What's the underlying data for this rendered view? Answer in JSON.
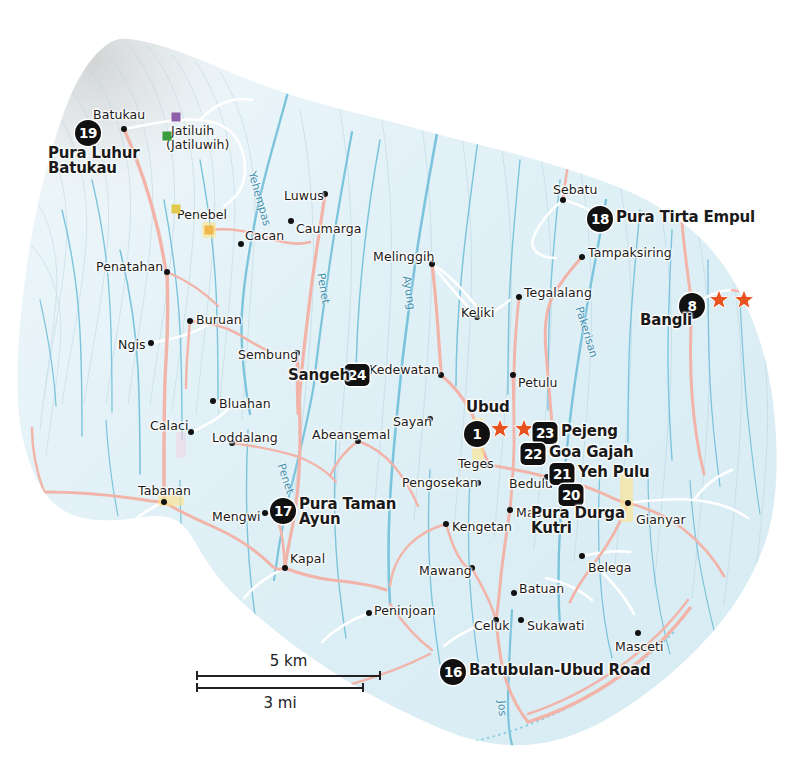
{
  "map": {
    "title": "Ubud and Central Bali Region Map",
    "colors": {
      "land": "#e8f2f6",
      "relief_highlight": "#f4f9fb",
      "road_major": "#f2b3a8",
      "road_minor": "#ffffff",
      "river": "#7cc4dc",
      "badge_bg": "#111111",
      "badge_text": "#ffffff",
      "star": "#e8521e",
      "label_text": "#1a1a1a",
      "river_label": "#3f8fae",
      "background": "#ffffff"
    }
  },
  "scalebar": {
    "km_label": "5 km",
    "mi_label": "3 mi"
  },
  "pois": [
    {
      "num": "19",
      "shape": "circle",
      "label": "Pura Luhur\nBatukau",
      "bx": 88,
      "by": 133,
      "tx": 48,
      "ty": 146,
      "align": "left",
      "lines": [
        "Pura Luhur",
        "Batukau"
      ]
    },
    {
      "num": "18",
      "shape": "circle",
      "label": "Pura Tirta Empul",
      "bx": 600,
      "by": 219,
      "tx": 616,
      "ty": 210,
      "align": "left",
      "lines": [
        "Pura Tirta Empul"
      ]
    },
    {
      "num": "8",
      "shape": "circle",
      "label": "Bangli",
      "bx": 692,
      "by": 306,
      "tx": 640,
      "ty": 313,
      "align": "left",
      "lines": [
        "Bangli"
      ]
    },
    {
      "num": "24",
      "shape": "square",
      "label": "Sangeh",
      "bx": 357,
      "by": 375,
      "tx": 288,
      "ty": 368,
      "align": "left",
      "lines": [
        "Sangeh"
      ]
    },
    {
      "num": "1",
      "shape": "circle",
      "label": "Ubud",
      "bx": 477,
      "by": 434,
      "tx": 466,
      "ty": 400,
      "align": "left",
      "lines": [
        "Ubud"
      ]
    },
    {
      "num": "23",
      "shape": "square",
      "label": "Pejeng",
      "bx": 545,
      "by": 433,
      "tx": 561,
      "ty": 424,
      "align": "left",
      "lines": [
        "Pejeng"
      ]
    },
    {
      "num": "22",
      "shape": "square",
      "label": "Goa Gajah",
      "bx": 533,
      "by": 454,
      "tx": 549,
      "ty": 445,
      "align": "left",
      "lines": [
        "Goa Gajah"
      ]
    },
    {
      "num": "21",
      "shape": "square",
      "label": "Yeh Pulu",
      "bx": 562,
      "by": 474,
      "tx": 578,
      "ty": 465,
      "align": "left",
      "lines": [
        "Yeh Pulu"
      ]
    },
    {
      "num": "20",
      "shape": "square",
      "label": "Pura Durga\nKutri",
      "bx": 571,
      "by": 495,
      "tx": 531,
      "ty": 506,
      "align": "left",
      "lines": [
        "Pura Durga",
        "Kutri"
      ]
    },
    {
      "num": "17",
      "shape": "circle",
      "label": "Pura Taman\nAyun",
      "bx": 283,
      "by": 511,
      "tx": 299,
      "ty": 497,
      "align": "left",
      "lines": [
        "Pura Taman",
        "Ayun"
      ]
    },
    {
      "num": "16",
      "shape": "circle",
      "label": "Batubulan-Ubud Road",
      "bx": 453,
      "by": 672,
      "tx": 469,
      "ty": 663,
      "align": "left",
      "lines": [
        "Batubulan-Ubud Road"
      ]
    }
  ],
  "stars": [
    {
      "x": 500,
      "y": 431
    },
    {
      "x": 524,
      "y": 431
    },
    {
      "x": 719,
      "y": 302
    },
    {
      "x": 744,
      "y": 302
    }
  ],
  "towns": [
    {
      "name": "Batukau",
      "dx": 124,
      "dy": 129,
      "tx": 93,
      "ty": 107,
      "anchor": "left"
    },
    {
      "name": "Jatiluih",
      "dx": 176,
      "dy": 117,
      "tx": 171,
      "ty": 123,
      "anchor": "left"
    },
    {
      "name": "(Jatiluwih)",
      "dx": null,
      "dy": null,
      "tx": 166,
      "ty": 137,
      "anchor": "left"
    },
    {
      "name": "Penebel",
      "dx": 209,
      "dy": 230,
      "tx": 177,
      "ty": 207,
      "anchor": "left"
    },
    {
      "name": "Cacan",
      "dx": 241,
      "dy": 244,
      "tx": 245,
      "ty": 228,
      "anchor": "left"
    },
    {
      "name": "Luwus",
      "dx": 325,
      "dy": 194,
      "tx": 284,
      "ty": 188,
      "anchor": "left"
    },
    {
      "name": "Caumarga",
      "dx": 291,
      "dy": 221,
      "tx": 296,
      "ty": 221,
      "anchor": "left"
    },
    {
      "name": "Penatahan",
      "dx": 167,
      "dy": 272,
      "tx": 96,
      "ty": 259,
      "anchor": "left"
    },
    {
      "name": "Melinggih",
      "dx": 432,
      "dy": 264,
      "tx": 373,
      "ty": 249,
      "anchor": "left"
    },
    {
      "name": "Sebatu",
      "dx": 563,
      "dy": 200,
      "tx": 553,
      "ty": 182,
      "anchor": "left"
    },
    {
      "name": "Tampaksiring",
      "dx": 582,
      "dy": 257,
      "tx": 588,
      "ty": 245,
      "anchor": "left"
    },
    {
      "name": "Tegalalang",
      "dx": 519,
      "dy": 297,
      "tx": 524,
      "ty": 285,
      "anchor": "left"
    },
    {
      "name": "Keliki",
      "dx": 477,
      "dy": 317,
      "tx": 461,
      "ty": 305,
      "anchor": "left"
    },
    {
      "name": "Buruan",
      "dx": 190,
      "dy": 321,
      "tx": 196,
      "ty": 312,
      "anchor": "left"
    },
    {
      "name": "Ngis",
      "dx": 151,
      "dy": 343,
      "tx": 118,
      "ty": 337,
      "anchor": "left"
    },
    {
      "name": "Sembung",
      "dx": 297,
      "dy": 353,
      "tx": 238,
      "ty": 347,
      "anchor": "left"
    },
    {
      "name": "Kedewatan",
      "dx": 441,
      "dy": 375,
      "tx": 369,
      "ty": 362,
      "anchor": "left"
    },
    {
      "name": "Petulu",
      "dx": 513,
      "dy": 375,
      "tx": 518,
      "ty": 375,
      "anchor": "left"
    },
    {
      "name": "Bluahan",
      "dx": 213,
      "dy": 401,
      "tx": 219,
      "ty": 396,
      "anchor": "left"
    },
    {
      "name": "Calaci",
      "dx": 191,
      "dy": 432,
      "tx": 150,
      "ty": 418,
      "anchor": "left"
    },
    {
      "name": "Loddalang",
      "dx": 232,
      "dy": 443,
      "tx": 212,
      "ty": 430,
      "anchor": "left"
    },
    {
      "name": "Abeansemal",
      "dx": 358,
      "dy": 441,
      "tx": 312,
      "ty": 427,
      "anchor": "left"
    },
    {
      "name": "Sayan",
      "dx": 430,
      "dy": 419,
      "tx": 393,
      "ty": 414,
      "anchor": "left"
    },
    {
      "name": "Teges",
      "dx": 489,
      "dy": 465,
      "tx": 458,
      "ty": 456,
      "anchor": "left"
    },
    {
      "name": "Bedulu",
      "dx": 547,
      "dy": 477,
      "tx": 509,
      "ty": 476,
      "anchor": "left"
    },
    {
      "name": "Pengosekan",
      "dx": 478,
      "dy": 483,
      "tx": 402,
      "ty": 475,
      "anchor": "left"
    },
    {
      "name": "Tabanan",
      "dx": 164,
      "dy": 502,
      "tx": 138,
      "ty": 483,
      "anchor": "left"
    },
    {
      "name": "Mengwi",
      "dx": 265,
      "dy": 513,
      "tx": 212,
      "ty": 509,
      "anchor": "left"
    },
    {
      "name": "Mas",
      "dx": 510,
      "dy": 510,
      "tx": 516,
      "ty": 505,
      "anchor": "left"
    },
    {
      "name": "Gianyar",
      "dx": 628,
      "dy": 503,
      "tx": 636,
      "ty": 512,
      "anchor": "left"
    },
    {
      "name": "Kengetan",
      "dx": 446,
      "dy": 524,
      "tx": 452,
      "ty": 519,
      "anchor": "left"
    },
    {
      "name": "Kapal",
      "dx": 285,
      "dy": 568,
      "tx": 290,
      "ty": 551,
      "anchor": "left"
    },
    {
      "name": "Belega",
      "dx": 582,
      "dy": 556,
      "tx": 588,
      "ty": 560,
      "anchor": "left"
    },
    {
      "name": "Mawang",
      "dx": 472,
      "dy": 568,
      "tx": 419,
      "ty": 563,
      "anchor": "left"
    },
    {
      "name": "Batuan",
      "dx": 514,
      "dy": 593,
      "tx": 519,
      "ty": 581,
      "anchor": "left"
    },
    {
      "name": "Peninjoan",
      "dx": 369,
      "dy": 613,
      "tx": 374,
      "ty": 603,
      "anchor": "left"
    },
    {
      "name": "Celuk",
      "dx": 496,
      "dy": 620,
      "tx": 474,
      "ty": 618,
      "anchor": "left"
    },
    {
      "name": "Sukawati",
      "dx": 521,
      "dy": 620,
      "tx": 527,
      "ty": 618,
      "anchor": "left"
    },
    {
      "name": "Masceti",
      "dx": 638,
      "dy": 633,
      "tx": 615,
      "ty": 639,
      "anchor": "left"
    }
  ],
  "rivers": [
    {
      "name": "Yehempas",
      "x": 258,
      "y": 170,
      "rot": 74
    },
    {
      "name": "Penet",
      "x": 327,
      "y": 272,
      "rot": 80
    },
    {
      "name": "Penet",
      "x": 287,
      "y": 462,
      "rot": 72
    },
    {
      "name": "Ayung",
      "x": 413,
      "y": 275,
      "rot": 82
    },
    {
      "name": "Pakerisan",
      "x": 585,
      "y": 305,
      "rot": 73
    },
    {
      "name": "Jos",
      "x": 508,
      "y": 700,
      "rot": 86
    }
  ],
  "markers": [
    {
      "color": "#8e5ea8",
      "x": 176,
      "y": 117
    },
    {
      "color": "#3c9b3c",
      "x": 167,
      "y": 136
    },
    {
      "color": "#e0c94a",
      "x": 176,
      "y": 209
    },
    {
      "color": "#f0b84a",
      "x": 209,
      "y": 230
    }
  ]
}
